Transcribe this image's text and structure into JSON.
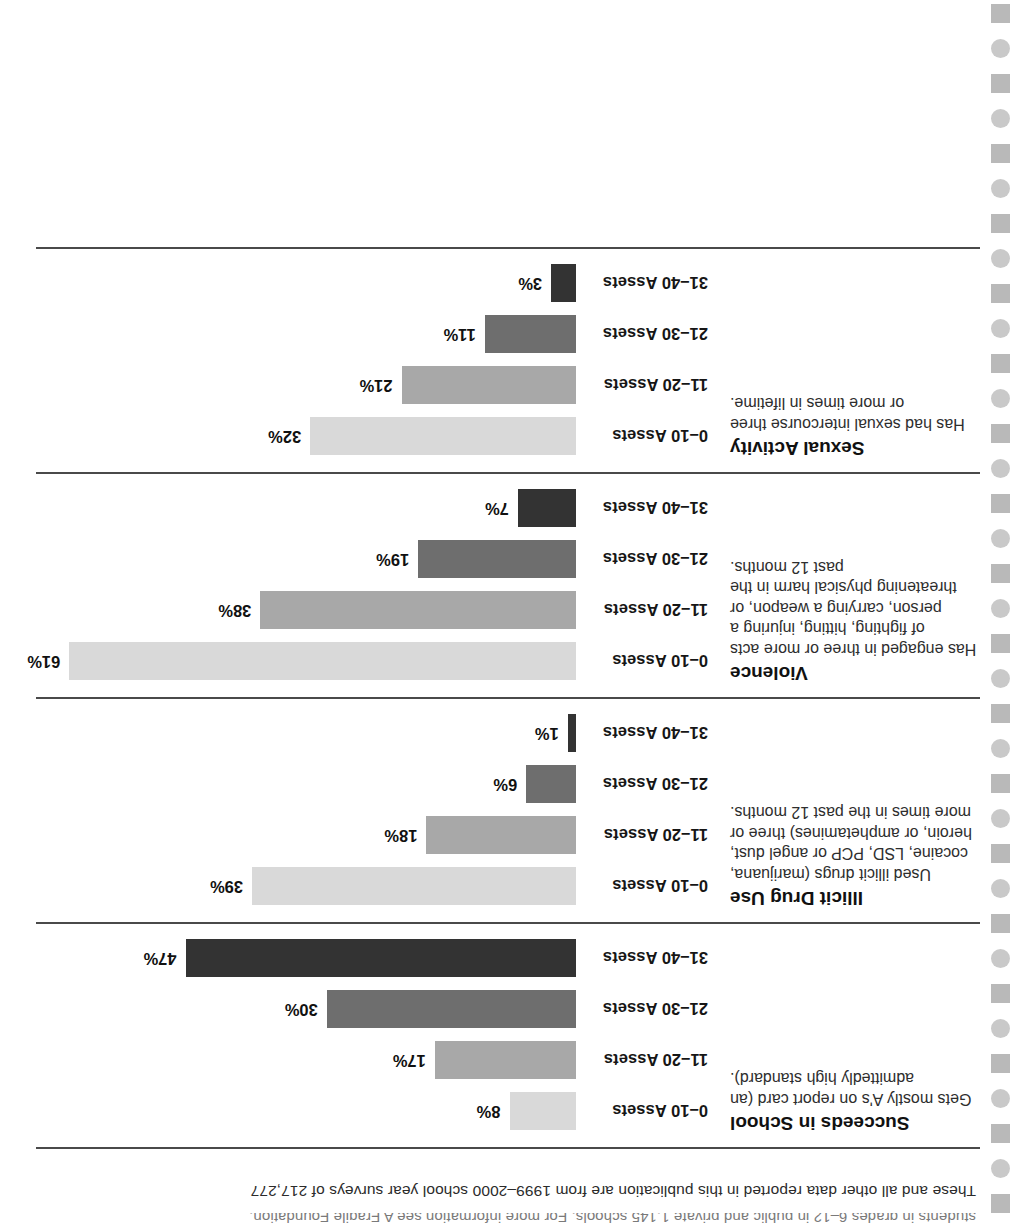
{
  "footnote": {
    "clipped_line": "students in grades 6–12 in public and private 1,145 schools. For more information see A Fragile Foundation.",
    "main_line": "These and all other data reported in this publication are from 1999–2000 school year surveys of 217,277"
  },
  "palette": {
    "bar_0_10": "#d9d9d9",
    "bar_11_20": "#a8a8a8",
    "bar_21_30": "#6e6e6e",
    "bar_31_40": "#333333",
    "rule": "#4a4a4a",
    "dot_square": "#b9b9b9",
    "dot_circle": "#c9c9c9",
    "text": "#1a1a1a"
  },
  "chart_data": {
    "type": "bar",
    "title": "",
    "xlabel": "",
    "ylabel": "",
    "xlim": [
      0,
      65
    ],
    "grid": false,
    "legend": "none",
    "orientation": "horizontal",
    "categories": [
      "0–10 Assets",
      "11–20 Assets",
      "21–30 Assets",
      "31–40 Assets"
    ],
    "panels": [
      {
        "title": "Succeeds in School",
        "description": "Gets mostly A's on report card (an admittedly high standard).",
        "values": [
          8,
          17,
          30,
          47
        ],
        "value_labels": [
          "8%",
          "17%",
          "30%",
          "47%"
        ]
      },
      {
        "title": "Illicit Drug Use",
        "description": "Used illicit drugs (marijuana, cocaine, LSD, PCP or angel dust, heroin, or amphetamines) three or more times in the past 12 months.",
        "values": [
          39,
          18,
          6,
          1
        ],
        "value_labels": [
          "39%",
          "18%",
          "6%",
          "1%"
        ]
      },
      {
        "title": "Violence",
        "description": "Has engaged in three or more acts of fighting, hitting, injuring a person, carrying a weapon, or threatening physical harm in the past 12 months.",
        "values": [
          61,
          38,
          19,
          7
        ],
        "value_labels": [
          "61%",
          "38%",
          "19%",
          "7%"
        ]
      },
      {
        "title": "Sexual Activity",
        "description": "Has had sexual intercourse three or more times in lifetime.",
        "values": [
          32,
          21,
          11,
          3
        ],
        "value_labels": [
          "32%",
          "21%",
          "11%",
          "3%"
        ]
      }
    ]
  }
}
